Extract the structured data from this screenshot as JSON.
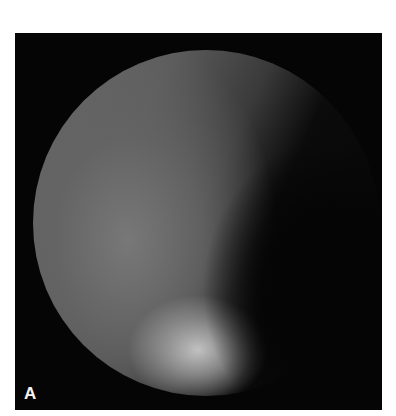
{
  "figure": {
    "panel_label": "A",
    "colors": {
      "background": "#ffffff",
      "panel": "#050505",
      "label": "#f4f4f4"
    }
  }
}
